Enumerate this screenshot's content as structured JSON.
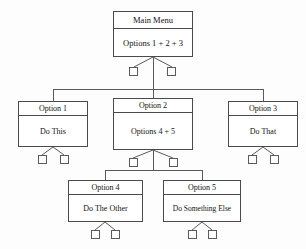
{
  "diagram": {
    "type": "hierarchy-tree",
    "levels": 3,
    "colors": {
      "background": "#fdfdfd",
      "box_fill": "#ffffff",
      "box_border": "#4a4a4a",
      "connector": "#5a5a5a",
      "text": "#111111"
    },
    "nodes": [
      {
        "id": "main-menu",
        "level": 1,
        "title": "Main Menu",
        "body": "Options 1 + 2 + 3",
        "stub_count": 2
      },
      {
        "id": "option-1",
        "level": 2,
        "title": "Option 1",
        "body": "Do This",
        "stub_count": 2
      },
      {
        "id": "option-2",
        "level": 2,
        "title": "Option 2",
        "body": "Options 4 + 5",
        "stub_count": 2
      },
      {
        "id": "option-3",
        "level": 2,
        "title": "Option 3",
        "body": "Do That",
        "stub_count": 2
      },
      {
        "id": "option-4",
        "level": 3,
        "title": "Option 4",
        "body": "Do The Other",
        "stub_count": 2
      },
      {
        "id": "option-5",
        "level": 3,
        "title": "Option 5",
        "body": "Do Something Else",
        "stub_count": 2
      }
    ],
    "edges": [
      {
        "from": "main-menu",
        "to": "option-1"
      },
      {
        "from": "main-menu",
        "to": "option-2"
      },
      {
        "from": "main-menu",
        "to": "option-3"
      },
      {
        "from": "option-2",
        "to": "option-4"
      },
      {
        "from": "option-2",
        "to": "option-5"
      }
    ]
  }
}
